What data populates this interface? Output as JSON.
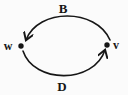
{
  "diagram": {
    "type": "directed-graph",
    "background_color": "#fbfbfb",
    "ink_color": "#161616",
    "nodes": [
      {
        "id": "w",
        "label": "w",
        "side": "left"
      },
      {
        "id": "v",
        "label": "v",
        "side": "right"
      }
    ],
    "edges": [
      {
        "label": "B",
        "from": "v",
        "to": "w",
        "position": "top",
        "shape": "arc"
      },
      {
        "label": "D",
        "from": "w",
        "to": "v",
        "position": "bottom",
        "shape": "arc"
      }
    ]
  }
}
